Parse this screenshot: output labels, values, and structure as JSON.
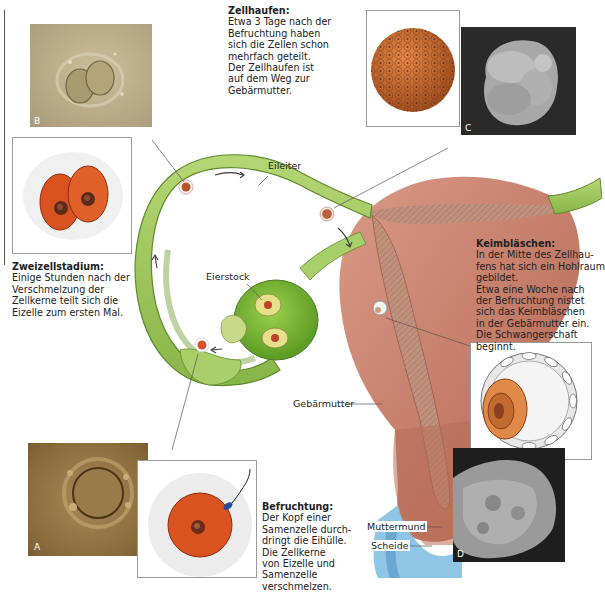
{
  "figure": {
    "language": "de",
    "colors": {
      "tube_green": "#9cc45a",
      "tube_green_dark": "#5c8a2a",
      "uterus": "#c9826e",
      "uterus_dark": "#9c5444",
      "endometrium": "#b88474",
      "vagina_blue": "#8fc6e6",
      "cell_orange": "#d9521f",
      "photo_sepia": "#b9a986",
      "photo_brown": "#8c6a3c",
      "sem_dark": "#2b2b2b"
    }
  },
  "captions": {
    "zellhaufen": {
      "title": "Zellhaufen:",
      "lines": [
        "Etwa 3 Tage nach der",
        "Befruchtung haben",
        "sich die Zellen schon",
        "mehrfach geteilt.",
        "Der Zellhaufen ist",
        "auf dem Weg zur",
        "Gebärmutter."
      ]
    },
    "zweizellstadium": {
      "title": "Zweizellstadium:",
      "lines": [
        "Einige Stunden nach der",
        "Verschmelzung der",
        "Zellkerne teilt sich die",
        "Eizelle zum ersten Mal."
      ]
    },
    "keimblaeschen": {
      "title": "Keimbläschen:",
      "lines": [
        "In der Mitte des Zellhau-",
        "fens hat sich ein Hohlraum",
        "gebildet.",
        "Etwa eine Woche nach",
        "der Befruchtung nistet",
        "sich das Keimbläschen",
        "in der Gebärmutter ein.",
        "Die Schwangerschaft",
        "beginnt."
      ]
    },
    "befruchtung": {
      "title": "Befruchtung:",
      "lines": [
        "Der Kopf einer",
        "Samenzelle durch-",
        "dringt die Eihülle.",
        "Die Zellkerne",
        "von Eizelle und",
        "Samenzelle",
        "verschmelzen."
      ]
    }
  },
  "labels": {
    "eileiter": "Eileiter",
    "eierstock": "Eierstock",
    "gebaermutter": "Gebärmutter",
    "muttermund": "Muttermund",
    "scheide": "Scheide"
  },
  "photos": {
    "a": {
      "letter": "A",
      "subject": "Eizelle (Mikroskopaufnahme)"
    },
    "b": {
      "letter": "B",
      "subject": "Zweizellstadium (Mikroskopaufnahme)"
    },
    "c": {
      "letter": "C",
      "subject": "Zellhaufen (Rasterelektronenmikroskop)"
    },
    "d": {
      "letter": "D",
      "subject": "Keimbläschen (Rasterelektronenmikroskop)"
    }
  }
}
